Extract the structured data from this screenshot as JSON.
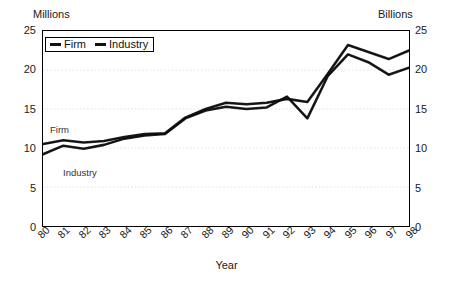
{
  "chart_data": {
    "type": "line",
    "title": "",
    "xlabel": "Year",
    "ylabel_left": "Millions",
    "ylabel_right": "Billions",
    "ylim": [
      0,
      25
    ],
    "yticks": [
      0,
      5,
      10,
      15,
      20,
      25
    ],
    "grid": true,
    "legend_position": "top-left",
    "categories": [
      "80",
      "81",
      "82",
      "83",
      "84",
      "85",
      "86",
      "87",
      "88",
      "89",
      "90",
      "91",
      "92",
      "93",
      "94",
      "95",
      "96",
      "97",
      "98"
    ],
    "series": [
      {
        "name": "Firm",
        "axis": "left",
        "unit": "Millions",
        "values": [
          10.5,
          11.0,
          10.7,
          10.9,
          11.4,
          11.8,
          11.9,
          13.9,
          15.0,
          15.8,
          15.6,
          15.8,
          16.3,
          15.9,
          19.5,
          23.2,
          22.3,
          21.4,
          22.5
        ]
      },
      {
        "name": "Industry",
        "axis": "right",
        "unit": "Billions",
        "values": [
          9.2,
          10.3,
          9.9,
          10.4,
          11.2,
          11.6,
          11.8,
          13.8,
          14.8,
          15.3,
          15.0,
          15.2,
          16.6,
          13.8,
          19.2,
          22.0,
          21.0,
          19.4,
          20.3
        ]
      }
    ],
    "annotations": [
      {
        "text": "Firm",
        "near_series": "Firm"
      },
      {
        "text": "Industry",
        "near_series": "Industry"
      }
    ]
  },
  "axes": {
    "left_unit": "Millions",
    "right_unit": "Billions",
    "x_title": "Year",
    "y_tick_labels": [
      "25",
      "20",
      "15",
      "10",
      "5",
      "0"
    ],
    "x_tick_labels": [
      "80",
      "81",
      "82",
      "83",
      "84",
      "85",
      "86",
      "87",
      "88",
      "89",
      "90",
      "91",
      "92",
      "93",
      "94",
      "95",
      "96",
      "97",
      "98"
    ]
  },
  "legend": {
    "items": [
      {
        "label": "Firm",
        "color": "#111111"
      },
      {
        "label": "Industry",
        "color": "#111111"
      }
    ]
  },
  "annotations": {
    "firm": "Firm",
    "industry": "Industry"
  },
  "colors": {
    "series_firm": "#111111",
    "series_industry": "#111111",
    "axis": "#000000",
    "grid": "#d8d8d8",
    "background": "#ffffff"
  }
}
